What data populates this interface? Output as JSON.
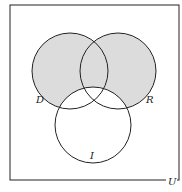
{
  "diagram": {
    "type": "venn",
    "universe_label": "U",
    "sets": [
      {
        "id": "D",
        "label": "D"
      },
      {
        "id": "R",
        "label": "R"
      },
      {
        "id": "I",
        "label": "I"
      }
    ],
    "shaded_region": "(D ∪ R) − I",
    "colors": {
      "shade": "#dcdcdc",
      "stroke": "#222222",
      "background": "#ffffff"
    }
  }
}
